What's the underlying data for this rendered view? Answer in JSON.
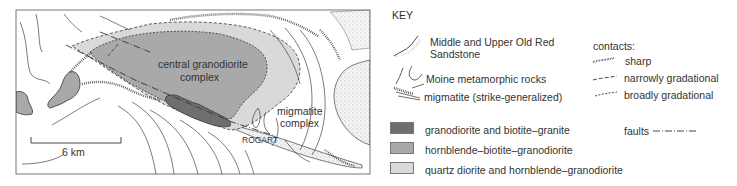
{
  "map": {
    "labels": {
      "central": [
        "central granodiorite",
        "complex"
      ],
      "migmatite": [
        "migmatite",
        "complex"
      ],
      "place": "ROGART",
      "scale": "6 km"
    },
    "colors": {
      "granodiorite_biotite_granite": "#6f6f6f",
      "hornblende_biotite_granodiorite": "#a9a9a9",
      "quartz_diorite": "#d9d9d9",
      "line": "#333333"
    }
  },
  "key": {
    "title": "KEY",
    "line_units": [
      {
        "label": [
          "Middle and Upper Old Red",
          "Sandstone"
        ],
        "icon": "sandstone-symbol"
      },
      {
        "label": [
          "Moine metamorphic rocks"
        ],
        "icon": "moine-symbol"
      },
      {
        "label": [
          "migmatite (strike-generalized)"
        ],
        "icon": "migmatite-symbol"
      }
    ],
    "contacts": {
      "title": "contacts:",
      "items": [
        {
          "label": "sharp",
          "style": "sharp"
        },
        {
          "label": "narrowly gradational",
          "style": "dashed"
        },
        {
          "label": "broadly gradational",
          "style": "dotted"
        }
      ]
    },
    "faults": {
      "label": "faults",
      "style": "dash-dot"
    },
    "fill_units": [
      {
        "label": "granodiorite and biotite–granite",
        "color": "#6f6f6f"
      },
      {
        "label": "hornblende–biotite–granodiorite",
        "color": "#a9a9a9"
      },
      {
        "label": "quartz diorite and hornblende–granodiorite",
        "color": "#d9d9d9"
      }
    ]
  }
}
